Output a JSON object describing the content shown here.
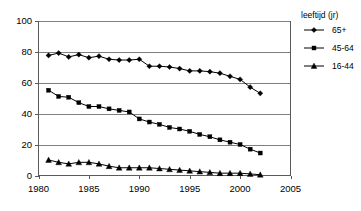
{
  "chart_data": {
    "type": "line",
    "title": "",
    "subtitle": "",
    "xlabel": "",
    "ylabel": "",
    "xlim": [
      1980,
      2005
    ],
    "ylim": [
      0,
      100
    ],
    "grid": true,
    "legend_position": "right",
    "legend_title": "leeftijd (jr)",
    "x_ticks": [
      "1980",
      "1985",
      "1990",
      "1995",
      "2000",
      "2005"
    ],
    "x_tick_values": [
      1980,
      1985,
      1990,
      1995,
      2000,
      2005
    ],
    "y_ticks": [
      "0",
      "20",
      "40",
      "60",
      "80",
      "100"
    ],
    "y_tick_values": [
      0,
      20,
      40,
      60,
      80,
      100
    ],
    "x": [
      1981,
      1982,
      1983,
      1984,
      1985,
      1986,
      1987,
      1988,
      1989,
      1990,
      1991,
      1992,
      1993,
      1994,
      1995,
      1996,
      1997,
      1998,
      1999,
      2000,
      2001,
      2002
    ],
    "series": [
      {
        "name": "65+",
        "marker": "diamond",
        "color": "#000000",
        "values": [
          77.5,
          79.0,
          76.5,
          78.0,
          76.0,
          77.0,
          75.0,
          74.5,
          74.5,
          75.0,
          70.5,
          70.5,
          70.0,
          69.0,
          67.5,
          67.5,
          67.0,
          66.0,
          64.0,
          62.0,
          57.0,
          53.0
        ]
      },
      {
        "name": "45-64",
        "marker": "square",
        "color": "#000000",
        "values": [
          55.0,
          51.0,
          50.5,
          47.0,
          44.5,
          44.5,
          43.0,
          42.0,
          41.0,
          36.5,
          34.5,
          33.0,
          31.0,
          30.0,
          28.5,
          26.5,
          25.0,
          23.0,
          21.5,
          20.0,
          17.0,
          14.5
        ]
      },
      {
        "name": "16-44",
        "marker": "triangle",
        "color": "#000000",
        "values": [
          10.0,
          8.5,
          7.5,
          8.5,
          8.5,
          7.5,
          6.0,
          5.0,
          5.0,
          5.0,
          5.0,
          4.5,
          4.0,
          3.5,
          3.0,
          2.5,
          2.0,
          1.5,
          1.5,
          1.5,
          1.0,
          0.5
        ]
      }
    ]
  },
  "legend": {
    "title": "leeftijd (jr)",
    "entries": [
      {
        "label": "65+",
        "marker": "diamond"
      },
      {
        "label": "45-64",
        "marker": "square"
      },
      {
        "label": "16-44",
        "marker": "triangle"
      }
    ]
  }
}
